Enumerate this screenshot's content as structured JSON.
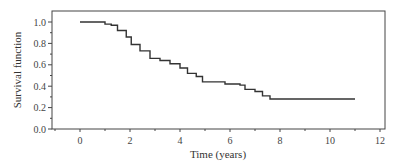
{
  "chart_data": {
    "type": "line",
    "step": true,
    "title": "",
    "xlabel": "Time (years)",
    "ylabel": "Survival function",
    "xlim": [
      -1.1,
      12
    ],
    "ylim": [
      0.0,
      1.1
    ],
    "xticks": [
      0,
      2,
      4,
      6,
      8,
      10,
      12
    ],
    "xtick_labels": [
      "0",
      "2",
      "4",
      "6",
      "8",
      "10",
      "12"
    ],
    "yticks": [
      0.0,
      0.2,
      0.4,
      0.6,
      0.8,
      1.0
    ],
    "ytick_labels": [
      "0.0",
      "0.2",
      "0.4",
      "0.6",
      "0.8",
      "1.0"
    ],
    "grid": false,
    "legend": null,
    "series": [
      {
        "name": "Survival function",
        "color": "#333333",
        "x": [
          0,
          1.0,
          1.25,
          1.5,
          1.85,
          2.05,
          2.4,
          2.8,
          3.2,
          3.6,
          4.0,
          4.3,
          4.65,
          4.9,
          5.6,
          5.8,
          6.4,
          6.6,
          7.0,
          7.3,
          7.6,
          11.0
        ],
        "y": [
          1.0,
          0.98,
          0.97,
          0.92,
          0.86,
          0.79,
          0.73,
          0.66,
          0.64,
          0.61,
          0.57,
          0.52,
          0.49,
          0.44,
          0.44,
          0.42,
          0.41,
          0.37,
          0.35,
          0.31,
          0.28,
          0.28
        ]
      }
    ]
  }
}
